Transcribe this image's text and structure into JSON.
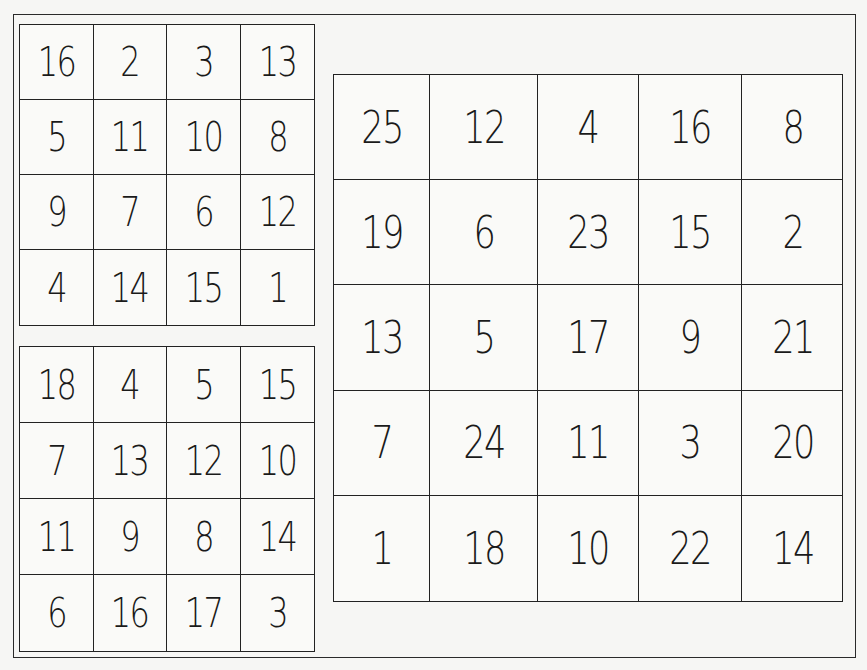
{
  "squares": [
    {
      "name": "4x4 magic square A",
      "size": 4,
      "rows": [
        [
          "16",
          "2",
          "3",
          "13"
        ],
        [
          "5",
          "11",
          "10",
          "8"
        ],
        [
          "9",
          "7",
          "6",
          "12"
        ],
        [
          "4",
          "14",
          "15",
          "1"
        ]
      ]
    },
    {
      "name": "4x4 magic square B",
      "size": 4,
      "rows": [
        [
          "18",
          "4",
          "5",
          "15"
        ],
        [
          "7",
          "13",
          "12",
          "10"
        ],
        [
          "11",
          "9",
          "8",
          "14"
        ],
        [
          "6",
          "16",
          "17",
          "3"
        ]
      ]
    },
    {
      "name": "5x5 magic square",
      "size": 5,
      "rows": [
        [
          "25",
          "12",
          "4",
          "16",
          "8"
        ],
        [
          "19",
          "6",
          "23",
          "15",
          "2"
        ],
        [
          "13",
          "5",
          "17",
          "9",
          "21"
        ],
        [
          "7",
          "24",
          "11",
          "3",
          "20"
        ],
        [
          "1",
          "18",
          "10",
          "22",
          "14"
        ]
      ]
    }
  ],
  "colors": {
    "ink": "#1a1a1a",
    "paper": "#f6f6f4"
  }
}
